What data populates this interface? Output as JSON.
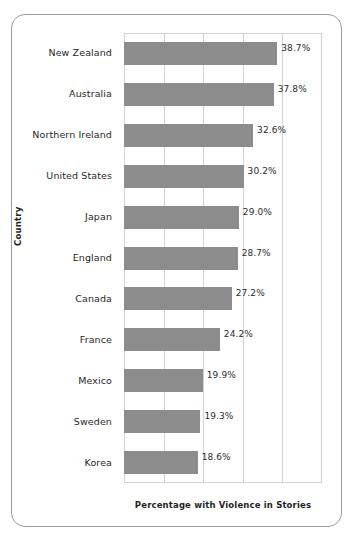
{
  "chart_data": {
    "type": "bar",
    "orientation": "horizontal",
    "title": "",
    "xlabel": "Percentage with Violence in Stories",
    "ylabel": "Country",
    "categories": [
      "New Zealand",
      "Australia",
      "Northern Ireland",
      "United States",
      "Japan",
      "England",
      "Canada",
      "France",
      "Mexico",
      "Sweden",
      "Korea"
    ],
    "values": [
      38.7,
      37.8,
      32.6,
      30.2,
      29.0,
      28.7,
      27.2,
      24.2,
      19.9,
      19.3,
      18.6
    ],
    "value_labels": [
      "38.7%",
      "37.8%",
      "32.6%",
      "30.2%",
      "29.0%",
      "28.7%",
      "27.2%",
      "24.2%",
      "19.9%",
      "19.3%",
      "18.6%"
    ],
    "xlim": [
      0,
      50
    ],
    "xticks": [
      0,
      10,
      20,
      30,
      40,
      50
    ],
    "xtick_labels": [
      "",
      "",
      "",
      "",
      "",
      ""
    ],
    "grid": "vertical",
    "legend": "none",
    "bar_color": "#8c8c8c",
    "grid_color": "#d2d2d2",
    "frame_color": "#9b9b9b",
    "background_color": "#ffffff",
    "text_color": "#1f1f1f"
  }
}
